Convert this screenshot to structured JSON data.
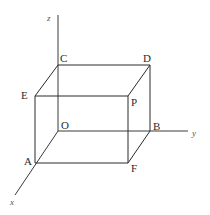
{
  "diagram": {
    "type": "3d-rectangular-box-on-axes",
    "axes": {
      "x": "x",
      "y": "y",
      "z": "z"
    },
    "vertices": {
      "O": "O",
      "A": "A",
      "B": "B",
      "C": "C",
      "D": "D",
      "E": "E",
      "F": "F",
      "P": "P"
    },
    "colors": {
      "line": "#2a2a2a",
      "background": "#ffffff"
    }
  }
}
